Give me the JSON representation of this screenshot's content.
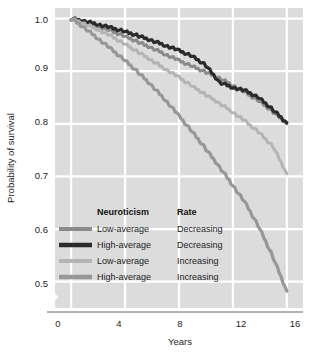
{
  "chart_data": {
    "type": "line",
    "title": "",
    "subtitle": "",
    "xlabel": "Years",
    "ylabel": "Probability of survival",
    "xlim": [
      -1.2,
      17.2
    ],
    "ylim": [
      0.45,
      1.02
    ],
    "xticks": [
      0,
      4,
      8,
      12,
      16
    ],
    "xticklabels": [
      "0",
      "4",
      "8",
      "12",
      "16"
    ],
    "yticks": [
      0.5,
      0.6,
      0.7,
      0.8,
      0.9,
      1.0
    ],
    "yticklabels": [
      "0.5",
      "0.6",
      "0.7",
      "0.8",
      "0.9",
      "1.0"
    ],
    "grid": true,
    "grid_color": "#ffffff",
    "plot_background": "#dcdcdc",
    "axis_break": true,
    "axis_break_note": "zigzag break on y-axis below 0.5",
    "legend_position": "lower-left-inside",
    "legend_columns": [
      "Neuroticism",
      "Rate"
    ],
    "x": [
      0,
      1,
      2,
      3,
      4,
      5,
      6,
      7,
      8,
      9,
      10,
      11,
      12,
      13,
      14,
      15,
      16
    ],
    "series": [
      {
        "name": "Low-average Decreasing",
        "neuroticism": "Low-average",
        "rate": "Decreasing",
        "color": "#8a8a8a",
        "width": 3.0,
        "values": [
          1.0,
          0.993,
          0.985,
          0.976,
          0.966,
          0.955,
          0.944,
          0.932,
          0.92,
          0.909,
          0.898,
          0.887,
          0.873,
          0.858,
          0.842,
          0.822,
          0.8
        ]
      },
      {
        "name": "High-average Decreasing",
        "neuroticism": "High-average",
        "rate": "Decreasing",
        "color": "#2b2b2b",
        "width": 3.2,
        "values": [
          1.0,
          0.995,
          0.989,
          0.982,
          0.975,
          0.967,
          0.958,
          0.949,
          0.939,
          0.928,
          0.911,
          0.879,
          0.869,
          0.862,
          0.848,
          0.826,
          0.802
        ]
      },
      {
        "name": "Low-average Increasing",
        "neuroticism": "Low-average",
        "rate": "Increasing",
        "color": "#b4b4b4",
        "width": 3.0,
        "values": [
          1.0,
          0.99,
          0.979,
          0.966,
          0.951,
          0.936,
          0.92,
          0.904,
          0.888,
          0.871,
          0.855,
          0.839,
          0.822,
          0.803,
          0.782,
          0.756,
          0.705
        ]
      },
      {
        "name": "High-average Increasing",
        "neuroticism": "High-average",
        "rate": "Increasing",
        "color": "#979797",
        "width": 3.2,
        "values": [
          1.0,
          0.982,
          0.962,
          0.941,
          0.92,
          0.897,
          0.872,
          0.845,
          0.815,
          0.784,
          0.752,
          0.718,
          0.683,
          0.646,
          0.6,
          0.545,
          0.482
        ]
      }
    ],
    "legend_entries": [
      {
        "neuroticism": "Low-average",
        "rate": "Decreasing",
        "color": "#8a8a8a"
      },
      {
        "neuroticism": "High-average",
        "rate": "Decreasing",
        "color": "#2b2b2b"
      },
      {
        "neuroticism": "Low-average",
        "rate": "Increasing",
        "color": "#b4b4b4"
      },
      {
        "neuroticism": "High-average",
        "rate": "Increasing",
        "color": "#979797"
      }
    ]
  },
  "axes": {
    "x_title": "Years",
    "y_title": "Probability of survival",
    "x_tick_0": "0",
    "x_tick_1": "4",
    "x_tick_2": "8",
    "x_tick_3": "12",
    "x_tick_4": "16",
    "y_tick_0": "1.0",
    "y_tick_1": "0.9",
    "y_tick_2": "0.8",
    "y_tick_3": "0.7",
    "y_tick_4": "0.6",
    "y_tick_5": "0.5"
  },
  "legend": {
    "header_neuroticism": "Neuroticism",
    "header_rate": "Rate",
    "row0_neuroticism": "Low-average",
    "row0_rate": "Decreasing",
    "row1_neuroticism": "High-average",
    "row1_rate": "Decreasing",
    "row2_neuroticism": "Low-average",
    "row2_rate": "Increasing",
    "row3_neuroticism": "High-average",
    "row3_rate": "Increasing"
  }
}
